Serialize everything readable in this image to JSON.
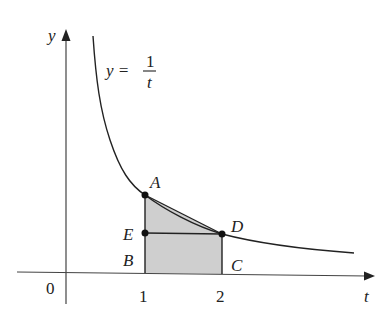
{
  "diagram": {
    "type": "function-graph",
    "function_label": {
      "lhs": "y =",
      "numerator": "1",
      "denominator": "t"
    },
    "axes": {
      "x_label": "t",
      "y_label": "y",
      "origin_label": "0"
    },
    "ticks": [
      {
        "value": "1"
      },
      {
        "value": "2"
      }
    ],
    "points": [
      {
        "name": "A",
        "desc": "(1, 1) on curve"
      },
      {
        "name": "B",
        "desc": "(1, 0)"
      },
      {
        "name": "C",
        "desc": "(2, 0)"
      },
      {
        "name": "D",
        "desc": "(2, 1/2) on curve"
      },
      {
        "name": "E",
        "desc": "(1, 1/2)"
      }
    ],
    "shaded_region": "trapezoid ABCD under chord AD",
    "colors": {
      "stroke": "#222222",
      "shade": "#cfcfcf",
      "background": "#ffffff"
    }
  }
}
